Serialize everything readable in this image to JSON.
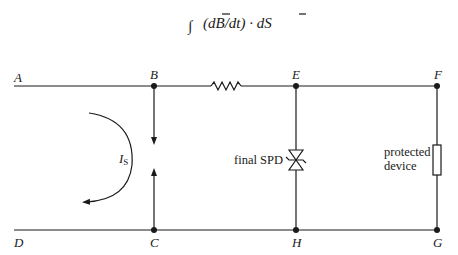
{
  "equation": {
    "integral": "∫",
    "text": "(dB̄/dt) · dS̄",
    "part1": "(d",
    "B": "B",
    "part2": "/dt) · d",
    "S": "S"
  },
  "nodes": {
    "A": "A",
    "B": "B",
    "C": "C",
    "D": "D",
    "E": "E",
    "F": "F",
    "G": "G",
    "H": "H"
  },
  "current_label": {
    "main": "I",
    "subscript": "S"
  },
  "components": {
    "spd_label": "final SPD",
    "device_label_line1": "protected",
    "device_label_line2": "device"
  },
  "colors": {
    "ink": "#1a1a1a",
    "background": "#ffffff"
  }
}
